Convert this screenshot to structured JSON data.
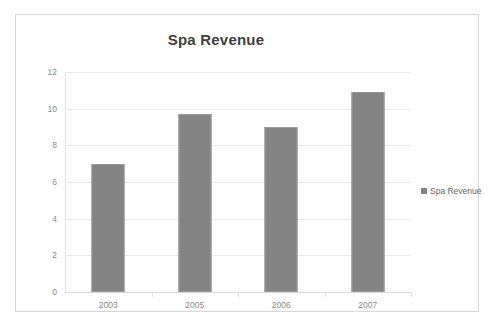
{
  "chart_data": {
    "type": "bar",
    "title": "Spa Revenue",
    "xlabel": "",
    "ylabel": "",
    "categories": [
      "2003",
      "2005",
      "2006",
      "2007"
    ],
    "values": [
      7.0,
      9.7,
      9.0,
      10.9
    ],
    "series": [
      {
        "name": "Spa Revenue",
        "values": [
          7.0,
          9.7,
          9.0,
          10.9
        ]
      }
    ],
    "ylim": [
      0,
      12
    ],
    "ytick_step": 2,
    "yticks": [
      "12",
      "10",
      "8",
      "6",
      "4",
      "2",
      "0"
    ],
    "grid": true,
    "legend_position": "right",
    "legend_entries": [
      "Spa Revenue"
    ],
    "bar_color": "#848484",
    "gridline_color": "#eaeaea",
    "title_color": "#404040",
    "tick_label_color": "#8a8a8a",
    "frame_color": "#d8d8d8"
  },
  "legend": {
    "items": [
      {
        "label": "Spa Revenue",
        "marker": "square-marker-icon",
        "color": "#848484"
      }
    ]
  }
}
